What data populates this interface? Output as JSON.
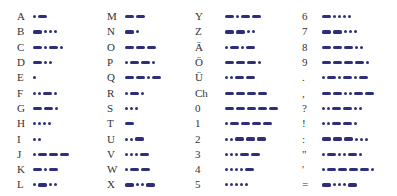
{
  "colors": {
    "symbol": "#2e2f7a",
    "label": "#333333",
    "background": "#ffffff"
  },
  "columns": [
    {
      "rows": [
        {
          "char": "A",
          "code": ".-"
        },
        {
          "char": "B",
          "code": "-..."
        },
        {
          "char": "C",
          "code": "-.-."
        },
        {
          "char": "D",
          "code": "-.."
        },
        {
          "char": "E",
          "code": "."
        },
        {
          "char": "F",
          "code": "..-."
        },
        {
          "char": "G",
          "code": "--."
        },
        {
          "char": "H",
          "code": "...."
        },
        {
          "char": "I",
          "code": ".."
        },
        {
          "char": "J",
          "code": ".---"
        },
        {
          "char": "K",
          "code": "-.-"
        },
        {
          "char": "L",
          "code": ".-.."
        }
      ]
    },
    {
      "rows": [
        {
          "char": "M",
          "code": "--"
        },
        {
          "char": "N",
          "code": "-."
        },
        {
          "char": "O",
          "code": "---"
        },
        {
          "char": "P",
          "code": ".--."
        },
        {
          "char": "Q",
          "code": "--.-"
        },
        {
          "char": "R",
          "code": ".-."
        },
        {
          "char": "S",
          "code": "..."
        },
        {
          "char": "T",
          "code": "-"
        },
        {
          "char": "U",
          "code": "..-"
        },
        {
          "char": "V",
          "code": "...-"
        },
        {
          "char": "W",
          "code": ".--"
        },
        {
          "char": "X",
          "code": "-..-"
        }
      ]
    },
    {
      "rows": [
        {
          "char": "Y",
          "code": "-.--"
        },
        {
          "char": "Z",
          "code": "--.."
        },
        {
          "char": "Ä",
          "code": ".-.-"
        },
        {
          "char": "Ö",
          "code": "---."
        },
        {
          "char": "Ü",
          "code": "..--"
        },
        {
          "char": "Ch",
          "code": "----"
        },
        {
          "char": "0",
          "code": "-----"
        },
        {
          "char": "1",
          "code": ".----"
        },
        {
          "char": "2",
          "code": "..---"
        },
        {
          "char": "3",
          "code": "...--"
        },
        {
          "char": "4",
          "code": "....-"
        },
        {
          "char": "5",
          "code": "....."
        }
      ]
    },
    {
      "rows": [
        {
          "char": "6",
          "code": "-...."
        },
        {
          "char": "7",
          "code": "--..."
        },
        {
          "char": "8",
          "code": "---.."
        },
        {
          "char": "9",
          "code": "----."
        },
        {
          "char": ".",
          "code": ".-.-.-"
        },
        {
          "char": ",",
          "code": "--..--"
        },
        {
          "char": "?",
          "code": "..--.."
        },
        {
          "char": "!",
          "code": "..--."
        },
        {
          "char": ":",
          "code": "---..."
        },
        {
          "char": "\"",
          "code": ".-..-."
        },
        {
          "char": "'",
          "code": ".----."
        },
        {
          "char": "=",
          "code": "-...-"
        }
      ]
    }
  ]
}
